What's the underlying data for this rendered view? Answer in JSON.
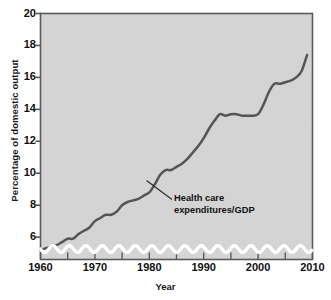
{
  "chart_data": {
    "type": "line",
    "title": "",
    "xlabel": "Year",
    "ylabel": "Percentage of domestic output",
    "xlim": [
      1960,
      2010
    ],
    "ylim": [
      4.6,
      20
    ],
    "grid": false,
    "legend_position": "inline-annotation",
    "axis_break": "wavy white break near bottom of y-axis (scale starts above zero)",
    "yticks": [
      20,
      18,
      16,
      14,
      12,
      10,
      8,
      6
    ],
    "xticks": [
      1960,
      1970,
      1980,
      1990,
      2000,
      2010
    ],
    "xticks_minor": [
      1965,
      1975,
      1985,
      1995,
      2005
    ],
    "series": [
      {
        "name": "Health care expenditures/GDP",
        "color": "#555555",
        "x": [
          1960,
          1961,
          1962,
          1963,
          1964,
          1965,
          1966,
          1967,
          1968,
          1969,
          1970,
          1971,
          1972,
          1973,
          1974,
          1975,
          1976,
          1977,
          1978,
          1979,
          1980,
          1981,
          1982,
          1983,
          1984,
          1985,
          1986,
          1987,
          1988,
          1989,
          1990,
          1991,
          1992,
          1993,
          1994,
          1995,
          1996,
          1997,
          1998,
          1999,
          2000,
          2001,
          2002,
          2003,
          2004,
          2005,
          2006,
          2007,
          2008,
          2009
        ],
        "values": [
          5.2,
          5.3,
          5.4,
          5.5,
          5.7,
          5.9,
          5.9,
          6.2,
          6.4,
          6.6,
          7.0,
          7.2,
          7.4,
          7.4,
          7.6,
          8.0,
          8.2,
          8.3,
          8.4,
          8.6,
          8.8,
          9.3,
          9.9,
          10.2,
          10.2,
          10.4,
          10.6,
          10.9,
          11.3,
          11.7,
          12.2,
          12.8,
          13.3,
          13.7,
          13.6,
          13.7,
          13.7,
          13.6,
          13.6,
          13.6,
          13.7,
          14.3,
          15.1,
          15.6,
          15.6,
          15.7,
          15.8,
          16.0,
          16.4,
          17.4
        ],
        "annotation_label": "Health care\nexpenditures/GDP"
      }
    ]
  },
  "axes": {
    "y_title": "Percentage of domestic output",
    "x_title": "Year",
    "y_tick_labels": [
      "20",
      "18",
      "16",
      "14",
      "12",
      "10",
      "8",
      "6"
    ],
    "x_tick_labels": [
      "1960",
      "1970",
      "1980",
      "1990",
      "2000",
      "2010"
    ]
  },
  "annotation": {
    "line1": "Health care",
    "line2": "expenditures/GDP"
  },
  "colors": {
    "plot_background": "#d4d4d4",
    "series_line": "#555555",
    "axis": "#5a5a5a",
    "text": "#111111",
    "axis_break": "#ffffff"
  },
  "source": {
    "text": ""
  }
}
